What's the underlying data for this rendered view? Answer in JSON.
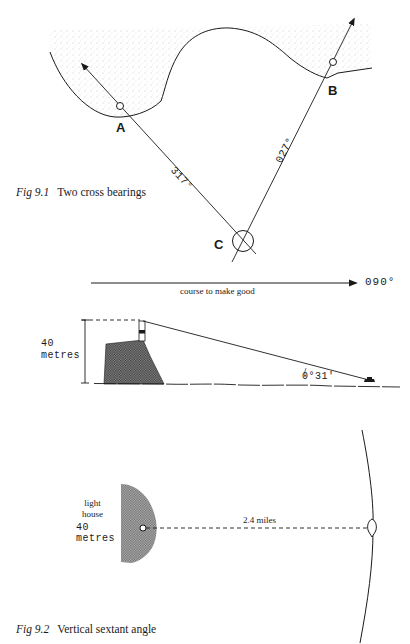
{
  "figure_1": {
    "caption": {
      "number": "Fig 9.1",
      "title": "Two cross bearings"
    },
    "points": {
      "a": {
        "label": "A"
      },
      "b": {
        "label": "B"
      },
      "c": {
        "label": "C"
      }
    },
    "bearings": {
      "to_a": "317°",
      "to_b": "027°"
    },
    "course": {
      "heading": "090°",
      "label": "course to make good"
    }
  },
  "figure_2": {
    "caption": {
      "number": "Fig 9.2",
      "title": "Vertical sextant angle"
    },
    "elevation": {
      "height_value": "40",
      "height_unit": "metres",
      "angle": "0°31'"
    },
    "plan": {
      "object_line1": "light",
      "object_line2": "house",
      "height_value": "40",
      "height_unit": "metres",
      "distance": "2.4 miles"
    }
  },
  "colors": {
    "ink": "#1a1a1a",
    "land_stipple": "#d9d9d9",
    "cliff_hatch": "#555555",
    "background": "#ffffff"
  }
}
